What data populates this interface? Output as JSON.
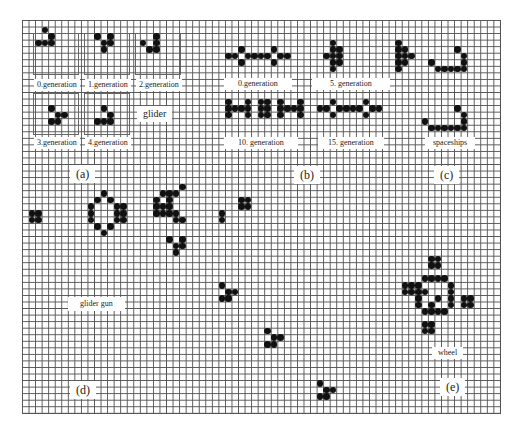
{
  "figure": {
    "grid": {
      "left": 22,
      "top": 20,
      "cell": 6.55,
      "cols": 73,
      "rows": 60
    }
  },
  "panels": {
    "a": {
      "letter": "(a)",
      "caption": "glider",
      "labels": [
        "0.generation",
        "1.generation",
        "2.generation",
        "3.generation",
        "4.generation"
      ]
    },
    "b": {
      "letter": "(b)",
      "labels": [
        "0.generation",
        "5. generation",
        "10. generation",
        "15. generation"
      ]
    },
    "c": {
      "letter": "(c)",
      "caption": "spaceships"
    },
    "d": {
      "letter": "(d)",
      "caption": "glider gun"
    },
    "e": {
      "letter": "(e)",
      "caption": "wheel"
    }
  },
  "cells": [
    [
      3,
      1
    ],
    [
      4,
      2
    ],
    [
      2,
      3
    ],
    [
      3,
      3
    ],
    [
      4,
      3
    ],
    [
      11,
      2
    ],
    [
      13,
      2
    ],
    [
      12,
      3
    ],
    [
      13,
      3
    ],
    [
      12,
      4
    ],
    [
      20,
      3
    ],
    [
      20,
      2
    ],
    [
      18,
      3
    ],
    [
      19,
      4
    ],
    [
      20,
      4
    ],
    [
      4,
      13
    ],
    [
      5,
      14
    ],
    [
      6,
      14
    ],
    [
      4,
      15
    ],
    [
      5,
      15
    ],
    [
      12,
      13
    ],
    [
      13,
      14
    ],
    [
      11,
      15
    ],
    [
      12,
      15
    ],
    [
      13,
      15
    ],
    [
      31,
      5
    ],
    [
      32,
      5
    ],
    [
      34,
      5
    ],
    [
      35,
      5
    ],
    [
      36,
      5
    ],
    [
      37,
      5
    ],
    [
      39,
      5
    ],
    [
      40,
      5
    ],
    [
      33,
      4
    ],
    [
      33,
      6
    ],
    [
      38,
      4
    ],
    [
      38,
      6
    ],
    [
      47,
      3
    ],
    [
      47,
      4
    ],
    [
      47,
      5
    ],
    [
      47,
      6
    ],
    [
      47,
      7
    ],
    [
      46,
      5
    ],
    [
      48,
      4
    ],
    [
      48,
      5
    ],
    [
      48,
      6
    ],
    [
      57,
      3
    ],
    [
      57,
      4
    ],
    [
      57,
      5
    ],
    [
      57,
      6
    ],
    [
      57,
      7
    ],
    [
      58,
      4
    ],
    [
      58,
      5
    ],
    [
      58,
      6
    ],
    [
      59,
      5
    ],
    [
      31,
      12
    ],
    [
      31,
      13
    ],
    [
      31,
      14
    ],
    [
      32,
      13
    ],
    [
      33,
      13
    ],
    [
      34,
      12
    ],
    [
      34,
      13
    ],
    [
      34,
      14
    ],
    [
      36,
      12
    ],
    [
      36,
      13
    ],
    [
      36,
      14
    ],
    [
      37,
      12
    ],
    [
      37,
      13
    ],
    [
      37,
      14
    ],
    [
      39,
      12
    ],
    [
      39,
      13
    ],
    [
      39,
      14
    ],
    [
      40,
      13
    ],
    [
      41,
      13
    ],
    [
      42,
      12
    ],
    [
      42,
      13
    ],
    [
      42,
      14
    ],
    [
      45,
      13
    ],
    [
      46,
      13
    ],
    [
      48,
      13
    ],
    [
      49,
      13
    ],
    [
      50,
      13
    ],
    [
      51,
      13
    ],
    [
      53,
      13
    ],
    [
      54,
      13
    ],
    [
      47,
      12
    ],
    [
      47,
      14
    ],
    [
      52,
      12
    ],
    [
      52,
      14
    ],
    [
      66,
      4
    ],
    [
      67,
      5
    ],
    [
      67,
      6
    ],
    [
      62,
      6
    ],
    [
      63,
      7
    ],
    [
      64,
      7
    ],
    [
      65,
      7
    ],
    [
      66,
      7
    ],
    [
      67,
      7
    ],
    [
      66,
      13
    ],
    [
      67,
      14
    ],
    [
      67,
      15
    ],
    [
      61,
      15
    ],
    [
      62,
      16
    ],
    [
      63,
      16
    ],
    [
      64,
      16
    ],
    [
      65,
      16
    ],
    [
      66,
      16
    ],
    [
      67,
      16
    ],
    [
      1,
      29
    ],
    [
      2,
      29
    ],
    [
      1,
      30
    ],
    [
      2,
      30
    ],
    [
      12,
      26
    ],
    [
      11,
      27
    ],
    [
      13,
      27
    ],
    [
      10,
      28
    ],
    [
      10,
      29
    ],
    [
      10,
      30
    ],
    [
      14,
      28
    ],
    [
      14,
      29
    ],
    [
      14,
      30
    ],
    [
      15,
      28
    ],
    [
      15,
      29
    ],
    [
      15,
      30
    ],
    [
      11,
      31
    ],
    [
      13,
      31
    ],
    [
      12,
      32
    ],
    [
      21,
      26
    ],
    [
      22,
      26
    ],
    [
      23,
      26
    ],
    [
      24,
      25
    ],
    [
      20,
      27
    ],
    [
      21,
      28
    ],
    [
      22,
      28
    ],
    [
      20,
      28
    ],
    [
      21,
      29
    ],
    [
      22,
      29
    ],
    [
      23,
      29
    ],
    [
      20,
      29
    ],
    [
      23,
      30
    ],
    [
      22,
      27
    ],
    [
      24,
      30
    ],
    [
      22,
      33
    ],
    [
      24,
      33
    ],
    [
      23,
      34
    ],
    [
      24,
      34
    ],
    [
      23,
      35
    ],
    [
      30,
      29
    ],
    [
      30,
      30
    ],
    [
      33,
      27
    ],
    [
      34,
      27
    ],
    [
      33,
      28
    ],
    [
      34,
      28
    ],
    [
      30,
      40
    ],
    [
      31,
      41
    ],
    [
      32,
      41
    ],
    [
      30,
      42
    ],
    [
      31,
      42
    ],
    [
      37,
      47
    ],
    [
      38,
      48
    ],
    [
      39,
      48
    ],
    [
      38,
      49
    ],
    [
      37,
      49
    ],
    [
      45,
      55
    ],
    [
      46,
      56
    ],
    [
      47,
      56
    ],
    [
      45,
      57
    ],
    [
      46,
      57
    ],
    [
      62,
      36
    ],
    [
      63,
      36
    ],
    [
      62,
      37
    ],
    [
      63,
      37
    ],
    [
      58,
      40
    ],
    [
      59,
      40
    ],
    [
      58,
      41
    ],
    [
      59,
      41
    ],
    [
      67,
      42
    ],
    [
      68,
      42
    ],
    [
      67,
      43
    ],
    [
      68,
      43
    ],
    [
      61,
      46
    ],
    [
      62,
      46
    ],
    [
      61,
      47
    ],
    [
      62,
      47
    ],
    [
      61,
      39
    ],
    [
      62,
      39
    ],
    [
      63,
      39
    ],
    [
      64,
      39
    ],
    [
      60,
      40
    ],
    [
      60,
      41
    ],
    [
      60,
      42
    ],
    [
      60,
      43
    ],
    [
      65,
      40
    ],
    [
      65,
      41
    ],
    [
      65,
      42
    ],
    [
      65,
      43
    ],
    [
      61,
      44
    ],
    [
      62,
      44
    ],
    [
      63,
      44
    ],
    [
      64,
      44
    ],
    [
      61,
      41
    ],
    [
      63,
      42
    ],
    [
      62,
      43
    ]
  ]
}
